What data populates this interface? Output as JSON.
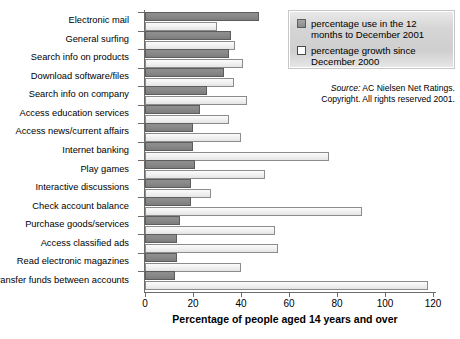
{
  "chart_data": {
    "type": "bar",
    "orientation": "horizontal",
    "title": "",
    "xlabel": "Percentage of people aged 14 years and over",
    "ylabel": "",
    "xlim": [
      0,
      120
    ],
    "xticks": [
      0,
      20,
      40,
      60,
      80,
      100,
      120
    ],
    "grid": false,
    "legend_position": "top-right",
    "categories": [
      "Electronic mail",
      "General surfing",
      "Search info on products",
      "Download software/files",
      "Search info on company",
      "Access education services",
      "Access news/current affairs",
      "Internet banking",
      "Play games",
      "Interactive discussions",
      "Check account balance",
      "Purchase goods/services",
      "Access classified ads",
      "Read electronic magazines",
      "Transfer funds between accounts"
    ],
    "series": [
      {
        "name": "percentage use in the 12 months to December 2001",
        "color": "#878787",
        "values": [
          47.5,
          36.0,
          35.0,
          33.0,
          26.0,
          23.0,
          20.0,
          20.0,
          21.0,
          19.0,
          19.0,
          14.5,
          13.5,
          13.5,
          12.5
        ]
      },
      {
        "name": "percentage growth since December 2000",
        "color": "#f1f1f1",
        "values": [
          30.0,
          37.5,
          41.0,
          37.0,
          42.5,
          35.0,
          40.0,
          76.5,
          50.0,
          27.5,
          90.5,
          54.0,
          55.5,
          40.0,
          118.0
        ]
      }
    ],
    "annotations": [
      "Source: AC Nielsen Net Ratings.",
      "Copyright. All rights reserved 2001."
    ]
  },
  "legend": {
    "items": [
      {
        "label": "percentage use in the 12 months to December 2001",
        "swatch": "filled-gray-square"
      },
      {
        "label": "percentage growth since December 2000",
        "swatch": "empty-white-square"
      }
    ]
  },
  "source": {
    "label": "Source:",
    "line1_rest": " AC Nielsen Net Ratings.",
    "line2": "Copyright. All rights reserved 2001."
  },
  "axis": {
    "x_title": "Percentage of people aged 14 years and over",
    "x_tick_labels": [
      "0",
      "20",
      "40",
      "60",
      "80",
      "100",
      "120"
    ]
  }
}
